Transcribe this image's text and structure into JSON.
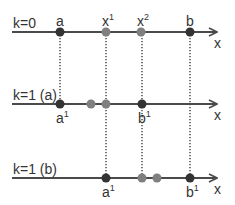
{
  "colors": {
    "axis": "#4a4a4a",
    "dark_point": "#333333",
    "gray_point": "#808080",
    "dotted": "#777777",
    "text": "#333333"
  },
  "rows": [
    {
      "label": "k=0",
      "axis_label": "x",
      "y": 32,
      "points": [
        {
          "x": 60,
          "kind": "dark",
          "label": "a",
          "sup": "",
          "label_pos": "above"
        },
        {
          "x": 106,
          "kind": "gray",
          "label": "x",
          "sup": "1",
          "label_pos": "above"
        },
        {
          "x": 141,
          "kind": "gray",
          "label": "x",
          "sup": "2",
          "label_pos": "above"
        },
        {
          "x": 190,
          "kind": "dark",
          "label": "b",
          "sup": "",
          "label_pos": "above"
        }
      ]
    },
    {
      "label": "k=1 (a)",
      "axis_label": "x",
      "y": 104,
      "points": [
        {
          "x": 60,
          "kind": "dark",
          "label": "a",
          "sup": "1",
          "label_pos": "below"
        },
        {
          "x": 91,
          "kind": "gray",
          "label": "",
          "sup": "",
          "label_pos": "none"
        },
        {
          "x": 106,
          "kind": "gray",
          "label": "",
          "sup": "",
          "label_pos": "none"
        },
        {
          "x": 142,
          "kind": "dark",
          "label": "b",
          "sup": "1",
          "label_pos": "below"
        }
      ]
    },
    {
      "label": "k=1 (b)",
      "axis_label": "x",
      "y": 178,
      "points": [
        {
          "x": 106,
          "kind": "dark",
          "label": "a",
          "sup": "1",
          "label_pos": "below"
        },
        {
          "x": 142,
          "kind": "gray",
          "label": "",
          "sup": "",
          "label_pos": "none"
        },
        {
          "x": 157,
          "kind": "gray",
          "label": "",
          "sup": "",
          "label_pos": "none"
        },
        {
          "x": 190,
          "kind": "dark",
          "label": "b",
          "sup": "1",
          "label_pos": "below"
        }
      ]
    }
  ],
  "dotted_guides": [
    {
      "x": 60,
      "y1": 32,
      "y2": 104
    },
    {
      "x": 106,
      "y1": 32,
      "y2": 178
    },
    {
      "x": 142,
      "y1": 32,
      "y2": 178
    },
    {
      "x": 190,
      "y1": 32,
      "y2": 178
    }
  ]
}
